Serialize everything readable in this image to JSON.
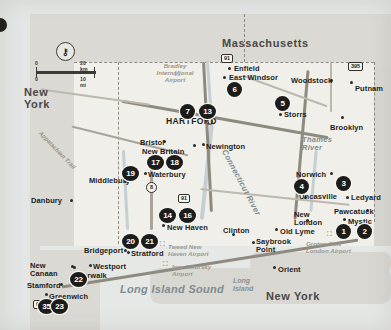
{
  "map": {
    "title": "Connecticut Tourist Map",
    "scale": {
      "km_start": "0",
      "km_end": "20 km",
      "mi_start": "0",
      "mi_end": "10 mi"
    },
    "locate_icon": "location-pin-icon",
    "states": [
      {
        "name": "Massachusetts",
        "x": 222,
        "y": 37,
        "size": "big"
      },
      {
        "name": "New York",
        "x": 24,
        "y": 86,
        "size": "big"
      },
      {
        "name": "New York",
        "x": 266,
        "y": 290,
        "size": "big"
      }
    ],
    "water_labels": [
      {
        "name": "Long Island Sound",
        "x": 120,
        "y": 283
      },
      {
        "name": "Connecticut River",
        "x": 228,
        "y": 148
      },
      {
        "name": "Thames River",
        "x": 302,
        "y": 136
      },
      {
        "name": "Long Island",
        "x": 233,
        "y": 277
      }
    ],
    "geo_labels": [
      {
        "name": "Appalachian Trail",
        "x": 42,
        "y": 130
      }
    ],
    "airports": [
      {
        "name": "Bradley International Airport",
        "x": 152,
        "y": 62
      },
      {
        "name": "Tweed New Haven Airport",
        "x": 168,
        "y": 243
      },
      {
        "name": "Igor Sikorsky Airport",
        "x": 172,
        "y": 263
      },
      {
        "name": "Groton-New London Airport",
        "x": 306,
        "y": 240
      }
    ],
    "cities": [
      {
        "name": "Enfield",
        "x": 234,
        "y": 64,
        "dot_x": 228,
        "dot_y": 67,
        "big": false
      },
      {
        "name": "East Windsor",
        "x": 229,
        "y": 73,
        "dot_x": 223,
        "dot_y": 76,
        "big": false
      },
      {
        "name": "Woodstock",
        "x": 291,
        "y": 76,
        "dot_x": 330,
        "dot_y": 79,
        "big": false
      },
      {
        "name": "Putnam",
        "x": 355,
        "y": 84,
        "dot_x": 350,
        "dot_y": 81,
        "big": false
      },
      {
        "name": "Storrs",
        "x": 284,
        "y": 110,
        "dot_x": 279,
        "dot_y": 113,
        "big": false
      },
      {
        "name": "Brooklyn",
        "x": 330,
        "y": 123,
        "dot_x": 341,
        "dot_y": 116,
        "big": false
      },
      {
        "name": "HARTFORD",
        "x": 166,
        "y": 116,
        "dot_x": 206,
        "dot_y": 118,
        "big": true
      },
      {
        "name": "Bristol",
        "x": 140,
        "y": 138,
        "dot_x": 163,
        "dot_y": 140,
        "big": false
      },
      {
        "name": "New Britain",
        "x": 142,
        "y": 147,
        "dot_x": 193,
        "dot_y": 144,
        "big": false
      },
      {
        "name": "Newington",
        "x": 206,
        "y": 142,
        "dot_x": 202,
        "dot_y": 143,
        "big": false
      },
      {
        "name": "Waterbury",
        "x": 148,
        "y": 170,
        "dot_x": 144,
        "dot_y": 172,
        "big": false
      },
      {
        "name": "Middlebury",
        "x": 89,
        "y": 176,
        "dot_x": 124,
        "dot_y": 180,
        "big": false
      },
      {
        "name": "Norwich",
        "x": 296,
        "y": 170,
        "dot_x": 330,
        "dot_y": 172,
        "big": false
      },
      {
        "name": "Uncasville",
        "x": 299,
        "y": 192,
        "dot_x": 304,
        "dot_y": 196,
        "big": false
      },
      {
        "name": "Ledyard",
        "x": 351,
        "y": 193,
        "dot_x": 346,
        "dot_y": 196,
        "big": false
      },
      {
        "name": "Pawcatuck",
        "x": 334,
        "y": 207,
        "dot_x": 366,
        "dot_y": 209,
        "big": false
      },
      {
        "name": "Mystic",
        "x": 348,
        "y": 217,
        "dot_x": 343,
        "dot_y": 218,
        "big": false
      },
      {
        "name": "New London",
        "x": 294,
        "y": 211,
        "dot_x": 306,
        "dot_y": 219,
        "big": false
      },
      {
        "name": "Old Lyme",
        "x": 280,
        "y": 227,
        "dot_x": 275,
        "dot_y": 228,
        "big": false
      },
      {
        "name": "Saybrook Point",
        "x": 256,
        "y": 238,
        "dot_x": 252,
        "dot_y": 241,
        "big": false
      },
      {
        "name": "New Haven",
        "x": 167,
        "y": 223,
        "dot_x": 162,
        "dot_y": 224,
        "big": false
      },
      {
        "name": "Clinton",
        "x": 223,
        "y": 226,
        "dot_x": 232,
        "dot_y": 233,
        "big": false
      },
      {
        "name": "Danbury",
        "x": 31,
        "y": 196,
        "dot_x": 70,
        "dot_y": 199,
        "big": false
      },
      {
        "name": "Bridgeport",
        "x": 84,
        "y": 246,
        "dot_x": 124,
        "dot_y": 249,
        "big": false
      },
      {
        "name": "Stratford",
        "x": 131,
        "y": 249,
        "dot_x": 127,
        "dot_y": 251,
        "big": false
      },
      {
        "name": "Westport",
        "x": 93,
        "y": 262,
        "dot_x": 89,
        "dot_y": 264,
        "big": false
      },
      {
        "name": "Norwalk",
        "x": 77,
        "y": 271,
        "dot_x": 73,
        "dot_y": 266,
        "big": false
      },
      {
        "name": "New Canaan",
        "x": 30,
        "y": 262,
        "dot_x": 71,
        "dot_y": 265,
        "big": false
      },
      {
        "name": "Stamford",
        "x": 27,
        "y": 281,
        "dot_x": 60,
        "dot_y": 283,
        "big": false
      },
      {
        "name": "Greenwich",
        "x": 49,
        "y": 292,
        "dot_x": 45,
        "dot_y": 293,
        "big": false
      },
      {
        "name": "Orient",
        "x": 278,
        "y": 265,
        "dot_x": 273,
        "dot_y": 266,
        "big": false
      }
    ],
    "poi_markers": [
      {
        "num": "1",
        "x": 336,
        "y": 224
      },
      {
        "num": "2",
        "x": 357,
        "y": 224
      },
      {
        "num": "3",
        "x": 336,
        "y": 176
      },
      {
        "num": "4",
        "x": 294,
        "y": 179
      },
      {
        "num": "5",
        "x": 275,
        "y": 96
      },
      {
        "num": "6",
        "x": 227,
        "y": 82
      },
      {
        "num": "7",
        "x": 180,
        "y": 104
      },
      {
        "num": "13",
        "x": 199,
        "y": 104
      },
      {
        "num": "17",
        "x": 147,
        "y": 155
      },
      {
        "num": "18",
        "x": 166,
        "y": 155
      },
      {
        "num": "19",
        "x": 122,
        "y": 166
      },
      {
        "num": "14",
        "x": 159,
        "y": 208
      },
      {
        "num": "16",
        "x": 179,
        "y": 208
      },
      {
        "num": "20",
        "x": 122,
        "y": 234
      },
      {
        "num": "21",
        "x": 141,
        "y": 234
      },
      {
        "num": "22",
        "x": 70,
        "y": 272
      },
      {
        "num": "35",
        "x": 38,
        "y": 299
      },
      {
        "num": "23",
        "x": 51,
        "y": 299
      }
    ],
    "route_shields": [
      {
        "num": "91",
        "x": 221,
        "y": 54
      },
      {
        "num": "395",
        "x": 348,
        "y": 62
      },
      {
        "num": "91",
        "x": 178,
        "y": 194
      },
      {
        "num": "8",
        "x": 146,
        "y": 182
      },
      {
        "num": "95",
        "x": 33,
        "y": 300
      }
    ]
  }
}
